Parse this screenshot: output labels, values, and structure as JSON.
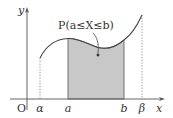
{
  "diagram": {
    "probability_label": "P(a≤X≤b)",
    "axes": {
      "x_label": "x",
      "y_label": "y",
      "origin_label": "O"
    },
    "x_ticks": [
      {
        "label": "α",
        "px": 40
      },
      {
        "label": "a",
        "px": 68
      },
      {
        "label": "b",
        "px": 124
      },
      {
        "label": "β",
        "px": 142
      }
    ],
    "colors": {
      "curve": "#444444",
      "shade": "#c8c8c8",
      "axis": "#555555",
      "dotted": "#777777"
    }
  }
}
